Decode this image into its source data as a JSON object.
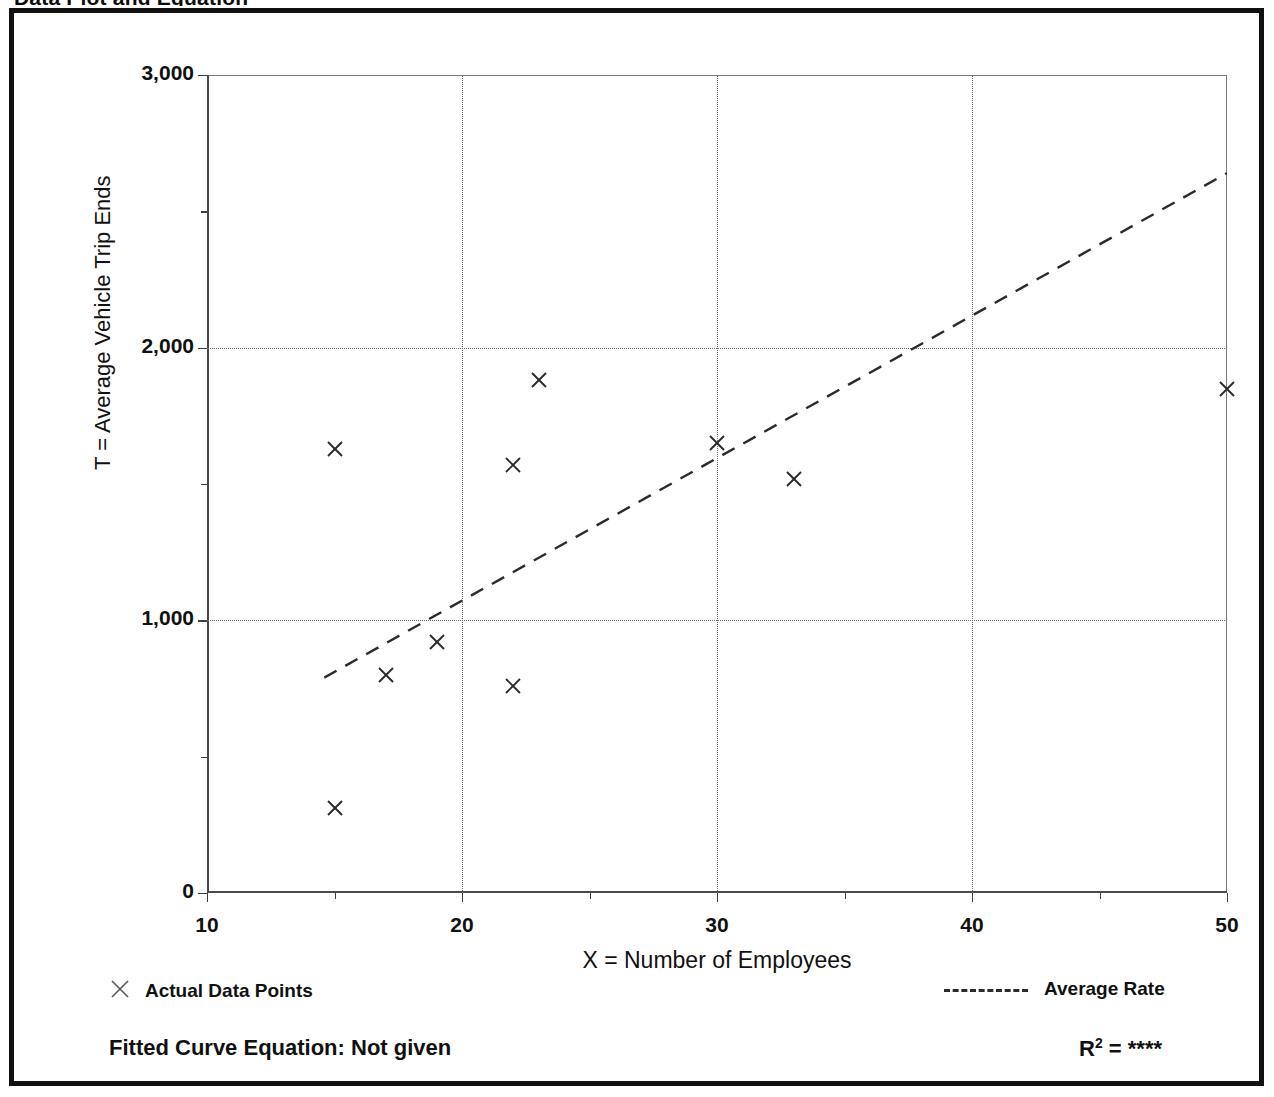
{
  "title_cropped": "Data Plot and Equation",
  "chart_data": {
    "type": "scatter",
    "title": "Data Plot and Equation",
    "xlabel": "X = Number of Employees",
    "ylabel": "T = Average Vehicle Trip Ends",
    "xlim": [
      10,
      50
    ],
    "ylim": [
      0,
      3000
    ],
    "grid": true,
    "x_ticks": [
      10,
      20,
      30,
      40,
      50
    ],
    "x_tick_labels": [
      "10",
      "20",
      "30",
      "40",
      "50"
    ],
    "x_minor_ticks": [
      15,
      25,
      35,
      45
    ],
    "y_ticks": [
      0,
      1000,
      2000,
      3000
    ],
    "y_tick_labels": [
      "0",
      "1,000",
      "2,000",
      "3,000"
    ],
    "y_minor_ticks": [
      500,
      1500,
      2500
    ],
    "series": [
      {
        "name": "Actual Data Points",
        "marker": "x",
        "x": [
          15,
          15,
          17,
          19,
          22,
          22,
          23,
          30,
          33,
          50
        ],
        "y": [
          1630,
          310,
          800,
          920,
          1570,
          760,
          1880,
          1650,
          1520,
          1850
        ]
      },
      {
        "name": "Average Rate",
        "type": "line",
        "style": "dashed",
        "x": [
          14.6,
          50
        ],
        "y": [
          790,
          2640
        ]
      }
    ],
    "legend": [
      {
        "label": "Actual Data Points",
        "marker": "x"
      },
      {
        "label": "Average Rate",
        "marker": "dashed-line"
      }
    ],
    "annotations": {
      "fitted_curve_equation": "Fitted Curve Equation:  Not given",
      "r_squared_label": "R",
      "r_squared_exponent": "2",
      "r_squared_value": "= ****"
    }
  },
  "colors": {
    "frame": "#111111",
    "axis": "#4a4a4a",
    "grid": "#6e6e6e",
    "marker": "#2b2b2b",
    "trend": "#2b2b2b",
    "background": "#ffffff"
  }
}
